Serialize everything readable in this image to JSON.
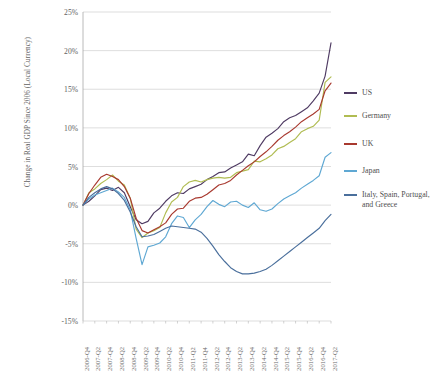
{
  "chart_data": {
    "type": "line",
    "title": "",
    "xlabel": "",
    "ylabel": "Change in Real GDP Since 2006 (Local Currency)",
    "ylim": [
      -15,
      25
    ],
    "ytick_labels": [
      "25%",
      "20%",
      "15%",
      "10%",
      "5%",
      "0%",
      "-5%",
      "-10%",
      "-15%"
    ],
    "ytick_values": [
      25,
      20,
      15,
      10,
      5,
      0,
      -5,
      -10,
      -15
    ],
    "grid": true,
    "legend_position": "right",
    "categories": [
      "2006-Q4",
      "2007-Q1",
      "2007-Q2",
      "2007-Q3",
      "2007-Q4",
      "2008-Q1",
      "2008-Q2",
      "2008-Q3",
      "2008-Q4",
      "2009-Q1",
      "2009-Q2",
      "2009-Q3",
      "2009-Q4",
      "2010-Q1",
      "2010-Q2",
      "2010-Q3",
      "2010-Q4",
      "2011-Q1",
      "2011-Q2",
      "2011-Q3",
      "2011-Q4",
      "2012-Q1",
      "2012-Q2",
      "2012-Q3",
      "2012-Q4",
      "2013-Q1",
      "2013-Q2",
      "2013-Q3",
      "2013-Q4",
      "2014-Q1",
      "2014-Q2",
      "2014-Q3",
      "2014-Q4",
      "2015-Q1",
      "2015-Q2",
      "2015-Q3",
      "2015-Q4",
      "2016-Q1",
      "2016-Q2",
      "2016-Q3",
      "2016-Q4",
      "2017-Q1",
      "2017-Q2"
    ],
    "xtick_labels": [
      "2006-Q4",
      "2007-Q2",
      "2007-Q4",
      "2008-Q2",
      "2008-Q4",
      "2009-Q2",
      "2009-Q4",
      "2010-Q2",
      "2010-Q4",
      "2011-Q2",
      "2011-Q4",
      "2012-Q2",
      "2012-Q4",
      "2013-Q2",
      "2013-Q4",
      "2014-Q2",
      "2014-Q4",
      "2015-Q2",
      "2015-Q4",
      "2016-Q2",
      "2016-Q4",
      "2017-Q2"
    ],
    "series": [
      {
        "name": "US",
        "color": "#4f3b63",
        "values": [
          0.0,
          0.5,
          1.2,
          2.0,
          2.2,
          1.9,
          2.3,
          1.6,
          -0.2,
          -1.9,
          -2.4,
          -2.1,
          -1.0,
          -0.4,
          0.5,
          1.2,
          1.6,
          1.5,
          2.1,
          2.4,
          2.7,
          3.3,
          3.7,
          4.2,
          4.3,
          4.8,
          5.2,
          5.6,
          6.6,
          6.4,
          7.7,
          8.8,
          9.3,
          9.9,
          10.8,
          11.3,
          11.6,
          12.1,
          12.6,
          13.5,
          14.5,
          16.7,
          21.0
        ]
      },
      {
        "name": "Germany",
        "color": "#b0bc52",
        "values": [
          0.0,
          1.6,
          2.1,
          2.8,
          3.3,
          3.9,
          3.1,
          2.6,
          0.9,
          -3.1,
          -4.2,
          -3.6,
          -3.3,
          -2.9,
          -1.0,
          0.4,
          1.0,
          2.4,
          3.0,
          3.2,
          3.0,
          3.3,
          3.5,
          3.6,
          3.5,
          3.6,
          4.2,
          4.4,
          4.6,
          5.7,
          5.6,
          6.0,
          6.5,
          7.3,
          7.6,
          8.1,
          8.6,
          9.5,
          9.9,
          10.2,
          11.0,
          15.9,
          16.6
        ]
      },
      {
        "name": "UK",
        "color": "#a8392f",
        "values": [
          0.0,
          1.5,
          2.6,
          3.6,
          4.0,
          3.7,
          3.3,
          2.4,
          0.9,
          -1.7,
          -3.3,
          -3.6,
          -3.2,
          -2.8,
          -2.3,
          -1.2,
          -0.5,
          -0.4,
          0.5,
          0.9,
          1.0,
          1.4,
          2.0,
          2.6,
          2.8,
          3.2,
          3.9,
          4.5,
          5.1,
          5.6,
          6.3,
          6.9,
          7.6,
          8.4,
          9.0,
          9.5,
          10.1,
          10.8,
          11.3,
          11.8,
          12.4,
          14.8,
          15.8
        ]
      },
      {
        "name": "Japan",
        "color": "#5fa8d3",
        "values": [
          0.0,
          0.8,
          1.3,
          1.6,
          1.9,
          2.2,
          1.7,
          1.0,
          -0.6,
          -4.3,
          -7.7,
          -5.4,
          -5.2,
          -4.9,
          -4.1,
          -2.4,
          -1.4,
          -1.6,
          -2.9,
          -1.9,
          -1.2,
          -0.2,
          0.6,
          0.1,
          -0.2,
          0.4,
          0.5,
          0.0,
          -0.3,
          0.3,
          -0.6,
          -0.8,
          -0.5,
          0.2,
          0.8,
          1.2,
          1.6,
          2.2,
          2.7,
          3.2,
          3.8,
          6.2,
          6.8
        ]
      },
      {
        "name": "Italy, Spain, Portugal, and Greece",
        "color": "#4a6f9c",
        "values": [
          0.0,
          1.0,
          1.6,
          2.1,
          2.4,
          2.1,
          1.5,
          0.6,
          -0.9,
          -2.8,
          -4.1,
          -4.0,
          -3.8,
          -3.4,
          -3.0,
          -2.7,
          -2.8,
          -2.9,
          -3.0,
          -3.1,
          -3.5,
          -4.3,
          -5.3,
          -6.4,
          -7.3,
          -8.1,
          -8.6,
          -8.9,
          -8.9,
          -8.8,
          -8.6,
          -8.3,
          -7.8,
          -7.2,
          -6.6,
          -6.0,
          -5.4,
          -4.8,
          -4.2,
          -3.6,
          -3.0,
          -2.0,
          -1.2
        ]
      }
    ]
  },
  "legend": {
    "items": [
      {
        "label": "US"
      },
      {
        "label": "Germany"
      },
      {
        "label": "UK"
      },
      {
        "label": "Japan"
      },
      {
        "label": "Italy, Spain, Portugal, and Greece"
      }
    ]
  }
}
